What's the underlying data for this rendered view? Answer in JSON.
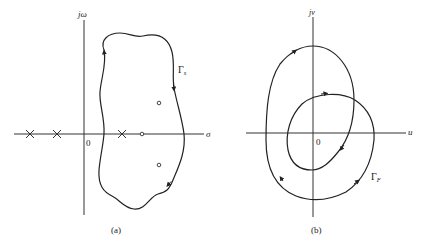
{
  "panel_a": {
    "caption": "(a)",
    "vertical_axis_label": "jω",
    "horizontal_axis_label": "σ",
    "origin_label": "0",
    "contour_label_main": "Γ",
    "contour_label_sub": "s",
    "poles": [
      "×",
      "×",
      "×"
    ],
    "zeros": [
      "○",
      "○",
      "○"
    ]
  },
  "panel_b": {
    "caption": "(b)",
    "vertical_axis_label": "jv",
    "horizontal_axis_label": "u",
    "origin_label": "0",
    "contour_label_main": "Γ",
    "contour_label_sub": "F"
  },
  "colors": {
    "ink": "#222222",
    "background": "#ffffff"
  }
}
